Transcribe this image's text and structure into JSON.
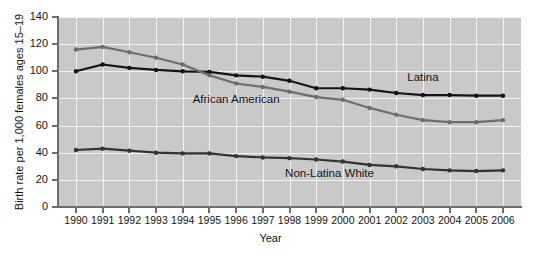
{
  "chart_data": {
    "type": "line",
    "title": "",
    "xlabel": "Year",
    "ylabel": "Birth rate per 1,000 females ages 15–19",
    "categories": [
      "1990",
      "1991",
      "1992",
      "1993",
      "1994",
      "1995",
      "1996",
      "1997",
      "1998",
      "1999",
      "2000",
      "2001",
      "2002",
      "2003",
      "2004",
      "2005",
      "2006"
    ],
    "x": [
      1990,
      1991,
      1992,
      1993,
      1994,
      1995,
      1996,
      1997,
      1998,
      1999,
      2000,
      2001,
      2002,
      2003,
      2004,
      2005,
      2006
    ],
    "ylim": [
      0,
      140
    ],
    "xlim": [
      1990,
      2006
    ],
    "yticks": [
      0,
      20,
      40,
      60,
      80,
      100,
      120,
      140
    ],
    "ytick_labels": [
      "0",
      "20",
      "40",
      "60",
      "80",
      "100",
      "120",
      "140"
    ],
    "grid": true,
    "legend_position": "inline-annotations",
    "plot_background": "#c9c9c9",
    "gridline_color": "#f2f2f2",
    "series": [
      {
        "name": "Latina",
        "color": "#141414",
        "label_x": 2003.0,
        "label_y": 95,
        "values": [
          100,
          105,
          102.5,
          101,
          100,
          99.5,
          97,
          96,
          93,
          87.5,
          87.5,
          86.5,
          84,
          82.5,
          82.5,
          82,
          82
        ]
      },
      {
        "name": "African American",
        "color": "#6d6d6d",
        "label_x": 1996.0,
        "label_y": 79,
        "values": [
          116,
          118,
          114,
          110,
          105,
          97,
          91,
          88.5,
          85,
          81,
          79,
          73,
          68,
          64,
          62.5,
          62.5,
          64
        ]
      },
      {
        "name": "Non-Latina White",
        "color": "#333333",
        "label_x": 1999.5,
        "label_y": 24,
        "values": [
          42,
          43,
          41.5,
          40,
          39.5,
          39.5,
          37.5,
          36.5,
          36,
          35,
          33.5,
          31,
          30,
          28,
          27,
          26.5,
          27
        ]
      }
    ]
  },
  "annotations": [
    {
      "text": "Latina"
    },
    {
      "text": "African American"
    },
    {
      "text": "Non-Latina White"
    }
  ]
}
